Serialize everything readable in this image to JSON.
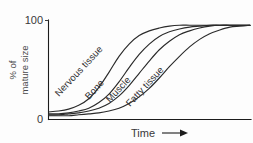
{
  "chart_data": {
    "type": "line",
    "title": "",
    "subtitle": "",
    "xlabel": "Time",
    "ylabel_line1": "% of",
    "ylabel_line2": "mature size",
    "x_tick_labels": [],
    "y_tick_labels": [
      "0",
      "100"
    ],
    "ylim": [
      0,
      105
    ],
    "xlim": [
      0,
      100
    ],
    "grid": false,
    "legend_position": "inline-on-curve",
    "x_axis_arrow": true,
    "x": [
      0,
      5,
      10,
      15,
      20,
      25,
      30,
      35,
      40,
      45,
      50,
      55,
      60,
      65,
      70,
      75,
      80,
      85,
      90,
      95,
      100
    ],
    "series": [
      {
        "name": "Nervous tissue",
        "label": "Nervous tissue",
        "label_rotation_deg": -47,
        "values": [
          8,
          9,
          11,
          15,
          22,
          34,
          50,
          67,
          80,
          89,
          94,
          97,
          99,
          100,
          100,
          100,
          100,
          100,
          100,
          100,
          100
        ]
      },
      {
        "name": "Bone",
        "label": "Bone",
        "label_rotation_deg": -47,
        "values": [
          6,
          6,
          7,
          9,
          12,
          18,
          27,
          40,
          55,
          69,
          80,
          88,
          93,
          96,
          98,
          99,
          100,
          100,
          100,
          100,
          100
        ]
      },
      {
        "name": "Muscle",
        "label": "Muscle",
        "label_rotation_deg": -47,
        "values": [
          5,
          5,
          6,
          7,
          9,
          12,
          17,
          25,
          36,
          49,
          62,
          74,
          83,
          90,
          94,
          97,
          99,
          100,
          100,
          100,
          100
        ]
      },
      {
        "name": "Fatty tissue",
        "label": "Fatty tissue",
        "label_rotation_deg": -47,
        "values": [
          4,
          4,
          4,
          5,
          6,
          7,
          9,
          12,
          17,
          24,
          33,
          44,
          56,
          67,
          77,
          85,
          91,
          95,
          98,
          99,
          100
        ]
      }
    ]
  },
  "axes": {
    "y_top_label": "100",
    "y_bottom_label": "0",
    "y_title_line1": "% of",
    "y_title_line2": "mature size",
    "x_title": "Time"
  },
  "curves": {
    "nervous": "Nervous tissue",
    "bone": "Bone",
    "muscle": "Muscle",
    "fatty": "Fatty tissue"
  }
}
